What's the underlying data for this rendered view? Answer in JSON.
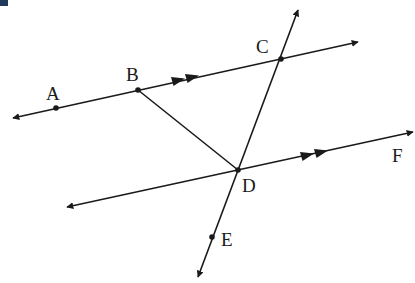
{
  "diagram": {
    "title": "",
    "line_color": "#1a1a1a",
    "points": [
      {
        "id": "A",
        "label": "A",
        "x": 56,
        "y": 108,
        "lx": 46,
        "ly": 100
      },
      {
        "id": "B",
        "label": "B",
        "x": 138,
        "y": 90,
        "lx": 126,
        "ly": 81
      },
      {
        "id": "C",
        "label": "C",
        "x": 281,
        "y": 59,
        "lx": 256,
        "ly": 53
      },
      {
        "id": "D",
        "label": "D",
        "x": 238,
        "y": 170,
        "lx": 242,
        "ly": 192
      },
      {
        "id": "E",
        "label": "E",
        "x": 212,
        "y": 237,
        "lx": 221,
        "ly": 246
      },
      {
        "id": "F",
        "label": "F",
        "x": 398,
        "y": 155,
        "lx": 392,
        "ly": 162
      }
    ],
    "lines": [
      {
        "id": "line-AC",
        "name": "line through A, B, C",
        "from": [
          13,
          118
        ],
        "to": [
          358,
          42
        ],
        "parallel_marks": 2
      },
      {
        "id": "line-DF",
        "name": "line through D and F",
        "from": [
          67,
          207
        ],
        "to": [
          413,
          132
        ],
        "parallel_marks": 2
      },
      {
        "id": "line-CE",
        "name": "transversal through C, D, E",
        "from": [
          298,
          10
        ],
        "to": [
          198,
          277
        ]
      },
      {
        "id": "segment-BD",
        "name": "segment BD",
        "from": [
          138,
          90
        ],
        "to": [
          238,
          170
        ]
      }
    ],
    "parallel_marks": [
      {
        "line": "line-AC",
        "positions": [
          [
            178,
            80
          ],
          [
            192,
            77
          ]
        ]
      },
      {
        "line": "line-DF",
        "positions": [
          [
            307,
            155
          ],
          [
            321,
            152
          ]
        ]
      }
    ]
  }
}
